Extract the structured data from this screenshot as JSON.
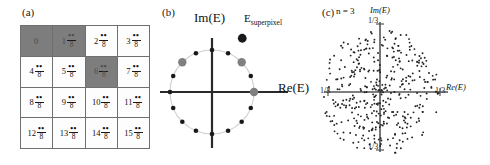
{
  "figure": {
    "panels": [
      "a",
      "b",
      "c"
    ]
  },
  "panel_a": {
    "label": "(a)",
    "denominator": "8",
    "numerator_symbol": "••",
    "cells": [
      {
        "index": "0",
        "shaded": true,
        "show_fraction": false
      },
      {
        "index": "1",
        "shaded": true,
        "show_fraction": true
      },
      {
        "index": "2",
        "shaded": false,
        "show_fraction": true
      },
      {
        "index": "3",
        "shaded": false,
        "show_fraction": true
      },
      {
        "index": "4",
        "shaded": false,
        "show_fraction": true
      },
      {
        "index": "5",
        "shaded": false,
        "show_fraction": true
      },
      {
        "index": "6",
        "shaded": true,
        "show_fraction": true
      },
      {
        "index": "7",
        "shaded": false,
        "show_fraction": true
      },
      {
        "index": "8",
        "shaded": false,
        "show_fraction": true
      },
      {
        "index": "9",
        "shaded": false,
        "show_fraction": true
      },
      {
        "index": "10",
        "shaded": false,
        "show_fraction": true
      },
      {
        "index": "11",
        "shaded": false,
        "show_fraction": true
      },
      {
        "index": "12",
        "shaded": false,
        "show_fraction": true
      },
      {
        "index": "13",
        "shaded": false,
        "show_fraction": true
      },
      {
        "index": "14",
        "shaded": false,
        "show_fraction": true
      },
      {
        "index": "15",
        "shaded": false,
        "show_fraction": true
      }
    ],
    "colors": {
      "shaded": "#7d7d7d",
      "unshaded": "#fdfdfd",
      "border": "#6f6f6f"
    }
  },
  "panel_b": {
    "label": "(b)",
    "im_axis_label": "Im(E)",
    "re_axis_label": "Re(E)",
    "superpixel_label": "E",
    "superpixel_sub": "superpixel",
    "colors": {
      "dot": "#1a1a1a",
      "highlight_dot": "#808080",
      "circle": "#c9c9c9",
      "axis": "#2a2a2a"
    },
    "chart_data": {
      "type": "scatter",
      "title": "Roots of unity on complex plane",
      "xlabel": "Re(E)",
      "ylabel": "Im(E)",
      "n_points": 16,
      "radius": 1.0,
      "angles_deg": [
        0,
        22.5,
        45,
        67.5,
        90,
        112.5,
        135,
        157.5,
        180,
        202.5,
        225,
        247.5,
        270,
        292.5,
        315,
        337.5
      ],
      "highlighted_indices": [
        0,
        2,
        6
      ],
      "superpixel_point": {
        "re": 0.72,
        "im": 1.28
      }
    }
  },
  "panel_c": {
    "label": "(c)",
    "n_label": "n = 3",
    "im_axis_label": "Im(E)",
    "re_axis_label": "Re(E)",
    "tick_top": "1/3",
    "tick_bottom": "1/3",
    "tick_left": "1/3",
    "tick_right": "1/3",
    "colors": {
      "dot": "#222222",
      "axis": "#555555"
    },
    "chart_data": {
      "type": "scatter",
      "title": "Achievable complex amplitudes, n = 3",
      "xlabel": "Re(E)",
      "ylabel": "Im(E)",
      "xlim": [
        -0.3333,
        0.3333
      ],
      "ylim": [
        -0.3333,
        0.3333
      ],
      "grid": false,
      "point_count": 400,
      "description": "Dense cloud of points filling a disk of radius 1/3 centred on the origin, denser near the centre"
    }
  }
}
